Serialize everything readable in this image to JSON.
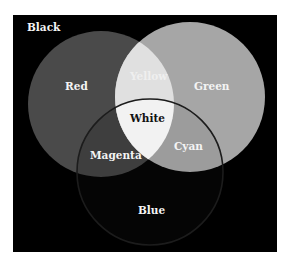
{
  "diagram": {
    "background_label": "Black",
    "colors": {
      "background": "#000000",
      "red": "#4a4a4a",
      "green": "#a6a6a6",
      "blue": "#050505",
      "yellow": "#e0e0e0",
      "magenta": "#3e3e3e",
      "cyan": "#9c9c9c",
      "white": "#f2f2f2",
      "blue_edge": "#1c1c1c",
      "label_light": "#f4f4f4",
      "label_dark": "#111111"
    },
    "circles": [
      {
        "name": "Red",
        "cx": 88,
        "cy": 89,
        "r": 73
      },
      {
        "name": "Green",
        "cx": 177,
        "cy": 82,
        "r": 75
      },
      {
        "name": "Blue",
        "cx": 137,
        "cy": 157,
        "r": 73
      }
    ],
    "labels": {
      "black": "Black",
      "red": "Red",
      "green": "Green",
      "blue": "Blue",
      "yellow": "Yellow",
      "magenta": "Magenta",
      "cyan": "Cyan",
      "white": "White"
    }
  }
}
